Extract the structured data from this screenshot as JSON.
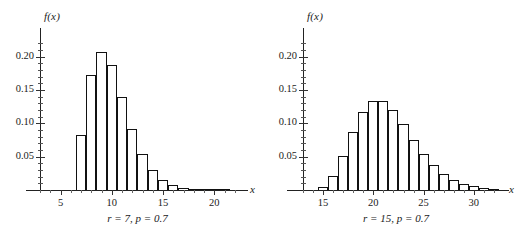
{
  "chart_data": [
    {
      "type": "bar",
      "title": "",
      "caption": "r = 7, p = 0.7",
      "xlabel": "x",
      "ylabel": "f(x)",
      "xlim": [
        3,
        22.5
      ],
      "ylim": [
        0,
        0.225
      ],
      "grid": false,
      "legend": null,
      "ytick_labels": [
        "0.05",
        "0.10",
        "0.15",
        "0.20"
      ],
      "ytick_values": [
        0.05,
        0.1,
        0.15,
        0.2
      ],
      "xtick_labels": [
        "5",
        "10",
        "15",
        "20"
      ],
      "xtick_values": [
        5,
        10,
        15,
        20
      ],
      "categories": [
        7,
        8,
        9,
        10,
        11,
        12,
        13,
        14,
        15,
        16,
        17,
        18,
        19,
        20,
        21
      ],
      "values": [
        0.0824,
        0.173,
        0.2076,
        0.1868,
        0.1397,
        0.0916,
        0.0545,
        0.03,
        0.0155,
        0.0076,
        0.0036,
        0.0016,
        0.0007,
        0.0003,
        0.0001
      ]
    },
    {
      "type": "bar",
      "title": "",
      "caption": "r = 15, p = 0.7",
      "xlabel": "x",
      "ylabel": "f(x)",
      "xlim": [
        13,
        32.5
      ],
      "ylim": [
        0,
        0.225
      ],
      "grid": false,
      "legend": null,
      "ytick_labels": [
        "0.05",
        "0.10",
        "0.15",
        "0.20"
      ],
      "ytick_values": [
        0.05,
        0.1,
        0.15,
        0.2
      ],
      "xtick_labels": [
        "15",
        "20",
        "25",
        "30"
      ],
      "xtick_values": [
        15,
        20,
        25,
        30
      ],
      "categories": [
        15,
        16,
        17,
        18,
        19,
        20,
        21,
        22,
        23,
        24,
        25,
        26,
        27,
        28,
        29,
        30,
        31,
        32
      ],
      "values": [
        0.0047,
        0.0212,
        0.0509,
        0.0865,
        0.1168,
        0.1331,
        0.1331,
        0.1198,
        0.0988,
        0.0757,
        0.0545,
        0.0372,
        0.0242,
        0.0151,
        0.0091,
        0.0053,
        0.003,
        0.0016
      ]
    }
  ],
  "panels": [
    {
      "name": "negative-binomial-r7",
      "caption": "r = 7, p = 0.7",
      "ylabel": "f(x)",
      "xlabel": "x"
    },
    {
      "name": "negative-binomial-r15",
      "caption": "r = 15, p = 0.7",
      "ylabel": "f(x)",
      "xlabel": "x"
    }
  ]
}
